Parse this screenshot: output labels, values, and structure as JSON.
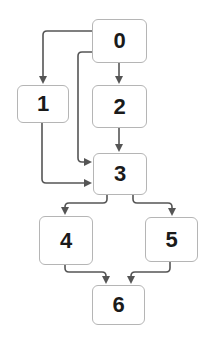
{
  "diagram": {
    "type": "directed-graph",
    "colors": {
      "edge": "#555555",
      "node_border": "#b5b5b5",
      "node_fill": "#ffffff",
      "text": "#1a1a1a"
    },
    "nodes": [
      {
        "id": "0",
        "label": "0",
        "x": 92,
        "y": 19,
        "w": 55,
        "h": 44
      },
      {
        "id": "1",
        "label": "1",
        "x": 17,
        "y": 85,
        "w": 52,
        "h": 38
      },
      {
        "id": "2",
        "label": "2",
        "x": 92,
        "y": 85,
        "w": 55,
        "h": 43
      },
      {
        "id": "3",
        "label": "3",
        "x": 93,
        "y": 153,
        "w": 54,
        "h": 42
      },
      {
        "id": "4",
        "label": "4",
        "x": 39,
        "y": 216,
        "w": 54,
        "h": 49
      },
      {
        "id": "5",
        "label": "5",
        "x": 145,
        "y": 217,
        "w": 53,
        "h": 45
      },
      {
        "id": "6",
        "label": "6",
        "x": 92,
        "y": 285,
        "w": 53,
        "h": 40
      }
    ],
    "edges": [
      {
        "from": "0",
        "to": "1",
        "path": "M92,31 L47,31 Q43,31 43,35 L43,82"
      },
      {
        "from": "0",
        "to": "2",
        "path": "M119,63 L119,82"
      },
      {
        "from": "0",
        "to": "3",
        "path": "M92,52 L82,52 Q78,52 78,56 L78,158 Q78,162 82,162 L90,162"
      },
      {
        "from": "1",
        "to": "3",
        "path": "M42,123 L42,179 Q42,183 46,183 L90,183"
      },
      {
        "from": "2",
        "to": "3",
        "path": "M119,128 L119,150"
      },
      {
        "from": "3",
        "to": "4",
        "path": "M107,195 L107,199 Q107,203 103,203 L69,203 Q65,203 65,207 L65,213"
      },
      {
        "from": "3",
        "to": "5",
        "path": "M133,195 L133,199 Q133,203 137,203 L168,203 Q172,203 172,207 L172,214"
      },
      {
        "from": "4",
        "to": "6",
        "path": "M65,265 L65,268 Q65,272 69,272 L102,272 Q106,272 106,276 L106,282"
      },
      {
        "from": "5",
        "to": "6",
        "path": "M170,262 L170,268 Q170,272 166,272 L135,272 Q131,272 131,276 L131,282"
      }
    ]
  }
}
